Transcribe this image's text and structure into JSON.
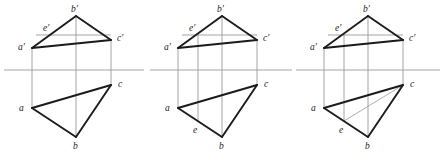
{
  "document": {
    "title": "Descriptive geometry: three-stage orthographic projection of triangle ABC with point E",
    "background_color": "#ffffff",
    "width": 444,
    "height": 160
  },
  "style": {
    "heavy_stroke_color": "#1b1b1b",
    "heavy_stroke_width": 1.9,
    "light_stroke_color": "#9a9a9a",
    "light_stroke_width": 0.9,
    "thin_stroke_color": "#8c8c8c",
    "thin_stroke_width": 0.7,
    "label_color": "#1b1b1b",
    "label_font_size": 9.5
  },
  "figures": [
    {
      "id": "figure-1",
      "name": "figure-1-initial-projection",
      "caption": "",
      "origin_x": 0,
      "points": {
        "a_prime": {
          "label": "a′",
          "x": 32,
          "y": 48,
          "label_x": 18,
          "label_y": 50
        },
        "b_prime": {
          "label": "b′",
          "x": 76,
          "y": 16,
          "label_x": 71,
          "label_y": 12
        },
        "c_prime": {
          "label": "c′",
          "x": 111,
          "y": 40,
          "label_x": 117,
          "label_y": 41
        },
        "e_prime": {
          "label": "e′",
          "x": 52,
          "y": 34,
          "label_x": 43,
          "label_y": 31
        },
        "a": {
          "label": "a",
          "x": 32,
          "y": 108,
          "label_x": 19,
          "label_y": 111
        },
        "b": {
          "label": "b",
          "x": 76,
          "y": 137,
          "label_x": 73,
          "label_y": 149
        },
        "c": {
          "label": "c",
          "x": 111,
          "y": 85,
          "label_x": 118,
          "label_y": 87
        },
        "e": {
          "label": "",
          "x": 0,
          "y": 0,
          "label_x": 0,
          "label_y": 0
        }
      },
      "ground_line": {
        "x1": 4,
        "y1": 70,
        "x2": 144,
        "y2": 70
      },
      "e_level_line": {
        "x1": 36,
        "y1": 35,
        "x2": 111,
        "y2": 35
      },
      "projectors": [
        {
          "x": 32,
          "y1": 48,
          "y2": 108
        },
        {
          "x": 76,
          "y1": 16,
          "y2": 137
        },
        {
          "x": 111,
          "y1": 40,
          "y2": 85
        }
      ],
      "heavy_edges": [
        {
          "from": "a_prime",
          "to": "b_prime"
        },
        {
          "from": "b_prime",
          "to": "c_prime"
        },
        {
          "from": "a_prime",
          "to": "c_prime"
        },
        {
          "from": "a",
          "to": "b"
        },
        {
          "from": "b",
          "to": "c"
        },
        {
          "from": "a",
          "to": "c"
        }
      ],
      "thin_edges": []
    },
    {
      "id": "figure-2",
      "name": "figure-2-point-e-located",
      "caption": "",
      "origin_x": 146,
      "points": {
        "a_prime": {
          "label": "a′",
          "x": 32,
          "y": 48,
          "label_x": 18,
          "label_y": 50
        },
        "b_prime": {
          "label": "b′",
          "x": 76,
          "y": 16,
          "label_x": 71,
          "label_y": 12
        },
        "c_prime": {
          "label": "c′",
          "x": 111,
          "y": 40,
          "label_x": 117,
          "label_y": 41
        },
        "e_prime": {
          "label": "e′",
          "x": 52,
          "y": 34,
          "label_x": 43,
          "label_y": 31
        },
        "a": {
          "label": "a",
          "x": 32,
          "y": 108,
          "label_x": 19,
          "label_y": 111
        },
        "b": {
          "label": "b",
          "x": 76,
          "y": 137,
          "label_x": 73,
          "label_y": 149
        },
        "c": {
          "label": "c",
          "x": 111,
          "y": 85,
          "label_x": 118,
          "label_y": 87
        },
        "e": {
          "label": "e",
          "x": 52,
          "y": 121,
          "label_x": 47,
          "label_y": 133
        }
      },
      "ground_line": {
        "x1": 4,
        "y1": 70,
        "x2": 146,
        "y2": 70
      },
      "e_level_line": {
        "x1": 36,
        "y1": 35,
        "x2": 111,
        "y2": 35
      },
      "projectors": [
        {
          "x": 32,
          "y1": 48,
          "y2": 108
        },
        {
          "x": 52,
          "y1": 34,
          "y2": 121
        },
        {
          "x": 76,
          "y1": 16,
          "y2": 137
        },
        {
          "x": 111,
          "y1": 40,
          "y2": 85
        }
      ],
      "heavy_edges": [
        {
          "from": "a_prime",
          "to": "b_prime"
        },
        {
          "from": "b_prime",
          "to": "c_prime"
        },
        {
          "from": "a_prime",
          "to": "c_prime"
        },
        {
          "from": "a",
          "to": "b"
        },
        {
          "from": "b",
          "to": "c"
        },
        {
          "from": "a",
          "to": "c"
        }
      ],
      "thin_edges": []
    },
    {
      "id": "figure-3",
      "name": "figure-3-auxiliary-line-ce",
      "caption": "",
      "origin_x": 292,
      "points": {
        "a_prime": {
          "label": "a′",
          "x": 32,
          "y": 48,
          "label_x": 18,
          "label_y": 50
        },
        "b_prime": {
          "label": "b′",
          "x": 76,
          "y": 16,
          "label_x": 71,
          "label_y": 12
        },
        "c_prime": {
          "label": "c′",
          "x": 111,
          "y": 40,
          "label_x": 117,
          "label_y": 41
        },
        "e_prime": {
          "label": "e′",
          "x": 52,
          "y": 34,
          "label_x": 43,
          "label_y": 31
        },
        "a": {
          "label": "a",
          "x": 32,
          "y": 108,
          "label_x": 19,
          "label_y": 111
        },
        "b": {
          "label": "b",
          "x": 76,
          "y": 137,
          "label_x": 73,
          "label_y": 149
        },
        "c": {
          "label": "c",
          "x": 111,
          "y": 85,
          "label_x": 118,
          "label_y": 87
        },
        "e": {
          "label": "e",
          "x": 52,
          "y": 121,
          "label_x": 47,
          "label_y": 133
        }
      },
      "ground_line": {
        "x1": 4,
        "y1": 70,
        "x2": 148,
        "y2": 70
      },
      "e_level_line": {
        "x1": 36,
        "y1": 35,
        "x2": 111,
        "y2": 35
      },
      "projectors": [
        {
          "x": 32,
          "y1": 48,
          "y2": 108
        },
        {
          "x": 52,
          "y1": 34,
          "y2": 121
        },
        {
          "x": 76,
          "y1": 16,
          "y2": 137
        },
        {
          "x": 111,
          "y1": 40,
          "y2": 85
        }
      ],
      "heavy_edges": [
        {
          "from": "a_prime",
          "to": "b_prime"
        },
        {
          "from": "b_prime",
          "to": "c_prime"
        },
        {
          "from": "a_prime",
          "to": "c_prime"
        },
        {
          "from": "a",
          "to": "b"
        },
        {
          "from": "b",
          "to": "c"
        },
        {
          "from": "a",
          "to": "c"
        }
      ],
      "thin_edges": [
        {
          "from": "c",
          "to": "e"
        }
      ]
    }
  ]
}
